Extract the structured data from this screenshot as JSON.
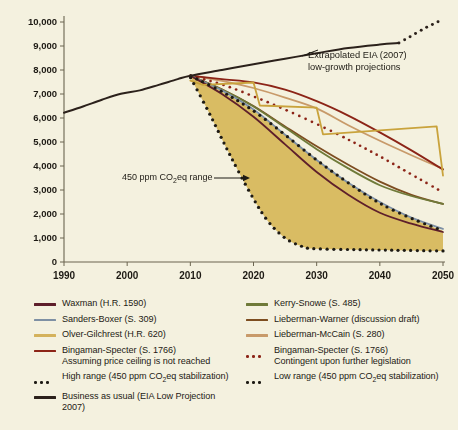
{
  "chart_data": {
    "type": "line",
    "title": "",
    "xlabel": "",
    "ylabel": "U.S. annual emissions (mmt CO2eq)",
    "ylabel_parts": {
      "pre": "U.S. annual emissions (mmt CO",
      "sub": "2",
      "post": "eq)"
    },
    "xlim": [
      1990,
      2050
    ],
    "ylim": [
      0,
      10000
    ],
    "xticks": [
      1990,
      2000,
      2010,
      2020,
      2030,
      2040,
      2050
    ],
    "xticklabels": [
      "1990",
      "2000",
      "2010",
      "2020",
      "2030",
      "2040",
      "2050"
    ],
    "yticks": [
      0,
      1000,
      2000,
      3000,
      4000,
      5000,
      6000,
      7000,
      8000,
      9000,
      10000
    ],
    "yticklabels": [
      "0",
      "1,000",
      "2,000",
      "3,000",
      "4,000",
      "5,000",
      "6,000",
      "7,000",
      "8,000",
      "9,000",
      "10,000"
    ],
    "grid": false,
    "legend_position": "below-plot-two-columns",
    "background_color": "#f4f1df",
    "plot_background_color": "#f4f1df",
    "axis_color": "#6b6550",
    "band": {
      "name": "450 ppm CO2eq range",
      "fill_color": "#d9bc63",
      "upper_series": "high_range",
      "lower_series": "low_range"
    },
    "series": [
      {
        "name": "Historical / Business as usual (EIA Low Projection 2007)",
        "key": "business_as_usual",
        "color": "#2b211b",
        "style": "solid",
        "width": 2.0,
        "x": [
          1990,
          1993,
          1996,
          1999,
          2002,
          2005,
          2008,
          2010,
          2015,
          2020,
          2025,
          2030,
          2035,
          2040,
          2043
        ],
        "y": [
          6220,
          6480,
          6760,
          7010,
          7150,
          7380,
          7620,
          7760,
          8000,
          8240,
          8470,
          8700,
          8920,
          9060,
          9120
        ]
      },
      {
        "name": "Business as usual extrapolated (dotted)",
        "key": "business_as_usual_extrapolated",
        "color": "#2b211b",
        "style": "dotted",
        "width": 2.4,
        "x": [
          2043,
          2045,
          2047,
          2049,
          2050
        ],
        "y": [
          9120,
          9420,
          9720,
          9980,
          10100
        ]
      },
      {
        "name": "Waxman (H.R. 1590)",
        "key": "waxman",
        "color": "#5e1f2b",
        "style": "solid",
        "width": 1.8,
        "x": [
          2010,
          2015,
          2020,
          2025,
          2030,
          2035,
          2040,
          2045,
          2050
        ],
        "y": [
          7760,
          7000,
          6050,
          4900,
          3750,
          2800,
          2050,
          1600,
          1250
        ]
      },
      {
        "name": "Sanders-Boxer (S. 309)",
        "key": "sanders_boxer",
        "color": "#7e90a4",
        "style": "solid",
        "width": 1.8,
        "x": [
          2010,
          2015,
          2020,
          2025,
          2030,
          2035,
          2040,
          2045,
          2050
        ],
        "y": [
          7760,
          7150,
          6350,
          5300,
          4250,
          3300,
          2500,
          1850,
          1380
        ]
      },
      {
        "name": "Olver-Gilchrest (H.R. 620)",
        "key": "olver_gilchrest",
        "color": "#c9a33c",
        "style": "solid-zigzag",
        "width": 1.8,
        "x": [
          2010,
          2012,
          2020,
          2021,
          2030,
          2031,
          2049,
          2050
        ],
        "y": [
          7560,
          7380,
          7480,
          6520,
          6430,
          5320,
          5650,
          3600
        ]
      },
      {
        "name": "Bingaman-Specter (S. 1766) Assuming price ceiling is not reached",
        "key": "bingaman_specter_ceiling",
        "color": "#8c2417",
        "style": "solid",
        "width": 1.8,
        "x": [
          2010,
          2015,
          2020,
          2025,
          2030,
          2035,
          2040,
          2045,
          2050
        ],
        "y": [
          7770,
          7620,
          7480,
          7180,
          6700,
          6100,
          5400,
          4650,
          3850
        ]
      },
      {
        "name": "Kerry-Snowe (S. 485)",
        "key": "kerry_snowe",
        "color": "#6f7a39",
        "style": "solid",
        "width": 1.8,
        "x": [
          2010,
          2015,
          2020,
          2025,
          2030,
          2035,
          2040,
          2045,
          2050
        ],
        "y": [
          7760,
          7180,
          6480,
          5600,
          4700,
          3900,
          3200,
          2750,
          2420
        ]
      },
      {
        "name": "Lieberman-Warner (discussion draft)",
        "key": "lieberman_warner",
        "color": "#7d4d20",
        "style": "solid",
        "width": 1.8,
        "x": [
          2010,
          2015,
          2020,
          2025,
          2030,
          2035,
          2040,
          2045,
          2050
        ],
        "y": [
          7760,
          7200,
          6500,
          5650,
          4820,
          4050,
          3350,
          2800,
          2420
        ]
      },
      {
        "name": "Lieberman-McCain (S. 280)",
        "key": "lieberman_mccain",
        "color": "#c89a6a",
        "style": "solid",
        "width": 1.8,
        "x": [
          2010,
          2015,
          2020,
          2025,
          2030,
          2035,
          2040,
          2045,
          2050
        ],
        "y": [
          7770,
          7550,
          7250,
          6850,
          6400,
          5700,
          5050,
          4450,
          3880
        ]
      },
      {
        "name": "Bingaman-Specter (S. 1766) Contingent upon further legislation",
        "key": "bingaman_specter_contingent",
        "color": "#8c2417",
        "style": "dotted",
        "width": 2.2,
        "x": [
          2010,
          2015,
          2020,
          2025,
          2030,
          2035,
          2040,
          2045,
          2050
        ],
        "y": [
          7760,
          7400,
          6900,
          6350,
          5750,
          5100,
          4400,
          3650,
          2900
        ]
      },
      {
        "name": "High range (450 ppm CO2eq stabilization)",
        "key": "high_range",
        "color": "#1d1a14",
        "style": "dotted",
        "width": 2.6,
        "x": [
          2010,
          2015,
          2020,
          2025,
          2030,
          2035,
          2040,
          2045,
          2050
        ],
        "y": [
          7760,
          7100,
          6300,
          5300,
          4250,
          3300,
          2450,
          1820,
          1300
        ]
      },
      {
        "name": "Low range (450 ppm CO2eq stabilization)",
        "key": "low_range",
        "color": "#1d1a14",
        "style": "dotted",
        "width": 2.6,
        "x": [
          2010,
          2013,
          2016,
          2019,
          2022,
          2025,
          2028,
          2030,
          2035,
          2040,
          2045,
          2050
        ],
        "y": [
          7700,
          6200,
          4600,
          3100,
          1800,
          1000,
          620,
          550,
          520,
          500,
          480,
          460
        ]
      }
    ],
    "annotations": [
      {
        "name": "extrapolated-eia-annotation",
        "line1": "Extrapolated EIA (2007)",
        "line2": "low-growth projections",
        "x": 2042,
        "y": 9300
      },
      {
        "name": "range-annotation",
        "text": "450 ppm CO2eq range",
        "text_pre": "450 ppm CO",
        "text_sub": "2",
        "text_post": "eq range",
        "has_arrow": true,
        "x": 2002,
        "y": 3300
      }
    ]
  },
  "legend": {
    "left_column": [
      {
        "label": "Waxman (H.R. 1590)",
        "sublabel": "",
        "color": "#5e1f2b",
        "style": "solid",
        "name": "legend-item-waxman"
      },
      {
        "label": "Sanders-Boxer (S. 309)",
        "sublabel": "",
        "color": "#7e90a4",
        "style": "solid",
        "name": "legend-item-sanders-boxer"
      },
      {
        "label": "Olver-Gilchrest (H.R. 620)",
        "sublabel": "",
        "color": "#d4b25c",
        "style": "solid",
        "name": "legend-item-olver-gilchrest"
      },
      {
        "label": "Bingaman-Specter (S. 1766)",
        "sublabel": "Assuming price ceiling is not reached",
        "color": "#8c2417",
        "style": "solid",
        "name": "legend-item-bingaman-specter-ceiling"
      },
      {
        "label": "High range (450 ppm CO2eq stabilization)",
        "label_pre": "High range (450 ppm CO",
        "label_sub": "2",
        "label_post": "eq stabilization)",
        "sublabel": "",
        "color": "#1d1a14",
        "style": "dotted",
        "name": "legend-item-high-range"
      },
      {
        "label": "Business as usual (EIA Low Projection 2007)",
        "sublabel": "",
        "color": "#2b211b",
        "style": "solid",
        "name": "legend-item-business-as-usual"
      }
    ],
    "right_column": [
      {
        "label": "Kerry-Snowe (S. 485)",
        "sublabel": "",
        "color": "#6f7a39",
        "style": "solid",
        "name": "legend-item-kerry-snowe"
      },
      {
        "label": "Lieberman-Warner (discussion draft)",
        "sublabel": "",
        "color": "#7d4d20",
        "style": "solid",
        "name": "legend-item-lieberman-warner"
      },
      {
        "label": "Lieberman-McCain (S. 280)",
        "sublabel": "",
        "color": "#c89a6a",
        "style": "solid",
        "name": "legend-item-lieberman-mccain"
      },
      {
        "label": "Bingaman-Specter (S. 1766)",
        "sublabel": "Contingent upon further legislation",
        "color": "#8c2417",
        "style": "dotted",
        "name": "legend-item-bingaman-specter-contingent"
      },
      {
        "label": "Low range (450 ppm CO2eq stabilization)",
        "label_pre": "Low range (450 ppm CO",
        "label_sub": "2",
        "label_post": "eq stabilization)",
        "sublabel": "",
        "color": "#1d1a14",
        "style": "dotted",
        "name": "legend-item-low-range"
      }
    ]
  }
}
